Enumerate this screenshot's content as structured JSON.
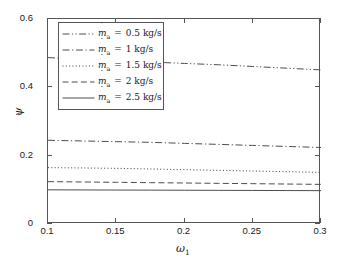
{
  "chart_data": {
    "type": "line",
    "title": "",
    "xlabel": "ω₁",
    "ylabel": "ψ",
    "xlim": [
      0.1,
      0.3
    ],
    "ylim": [
      0,
      0.6
    ],
    "grid": false,
    "legend_position": "upper-left-inside",
    "x_ticks": [
      "0.1",
      "0.15",
      "0.2",
      "0.25",
      "0.3"
    ],
    "x_tick_values": [
      0.1,
      0.15,
      0.2,
      0.25,
      0.3
    ],
    "y_ticks": [
      "0",
      "0.2",
      "0.4",
      "0.6"
    ],
    "y_tick_values": [
      0,
      0.2,
      0.4,
      0.6
    ],
    "x": [
      0.1,
      0.125,
      0.15,
      0.175,
      0.2,
      0.225,
      0.25,
      0.275,
      0.3
    ],
    "series": [
      {
        "name": "ṁ_a = 0.5 kg/s",
        "label_symbol": "m",
        "label_sub": "a",
        "label_value": "0.5",
        "label_unit": "kg/s",
        "linestyle": "dashdotdot",
        "color": "#4d4d4d",
        "values": [
          0.487,
          0.482,
          0.478,
          0.474,
          0.47,
          0.466,
          0.461,
          0.456,
          0.451
        ]
      },
      {
        "name": "ṁ_a = 1 kg/s",
        "label_symbol": "m",
        "label_sub": "a",
        "label_value": "1",
        "label_unit": "kg/s",
        "linestyle": "dashdot",
        "color": "#4d4d4d",
        "values": [
          0.245,
          0.243,
          0.241,
          0.239,
          0.236,
          0.233,
          0.23,
          0.227,
          0.224
        ]
      },
      {
        "name": "ṁ_a = 1.5 kg/s",
        "label_symbol": "m",
        "label_sub": "a",
        "label_value": "1.5",
        "label_unit": "kg/s",
        "linestyle": "dotted",
        "color": "#4d4d4d",
        "values": [
          0.165,
          0.164,
          0.163,
          0.161,
          0.159,
          0.157,
          0.155,
          0.153,
          0.151
        ]
      },
      {
        "name": "ṁ_a = 2 kg/s",
        "label_symbol": "m",
        "label_sub": "a",
        "label_value": "2",
        "label_unit": "kg/s",
        "linestyle": "dashed",
        "color": "#4d4d4d",
        "values": [
          0.124,
          0.123,
          0.122,
          0.121,
          0.12,
          0.119,
          0.118,
          0.117,
          0.116
        ]
      },
      {
        "name": "ṁ_a = 2.5 kg/s",
        "label_symbol": "m",
        "label_sub": "a",
        "label_value": "2.5",
        "label_unit": "kg/s",
        "linestyle": "solid",
        "color": "#4d4d4d",
        "values": [
          0.1,
          0.0997,
          0.0994,
          0.0991,
          0.0988,
          0.0985,
          0.0982,
          0.0979,
          0.0976
        ]
      }
    ]
  },
  "axis": {
    "y_title": "ψ",
    "x_title_symbol": "ω",
    "x_title_sub": "1"
  },
  "legend": {
    "rows": [
      {
        "value": "0.5",
        "unit": "kg/s",
        "sub": "a",
        "symbol": "m"
      },
      {
        "value": "1",
        "unit": "kg/s",
        "sub": "a",
        "symbol": "m"
      },
      {
        "value": "1.5",
        "unit": "kg/s",
        "sub": "a",
        "symbol": "m"
      },
      {
        "value": "2",
        "unit": "kg/s",
        "sub": "a",
        "symbol": "m"
      },
      {
        "value": "2.5",
        "unit": "kg/s",
        "sub": "a",
        "symbol": "m"
      }
    ],
    "equals": "="
  },
  "colors": {
    "line": "#4d4d4d",
    "axis": "#555555",
    "text": "#1a1a1a",
    "background": "#ffffff"
  }
}
